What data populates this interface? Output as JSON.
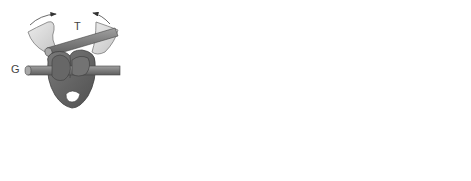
{
  "labels": {
    "t": "T",
    "g": "G"
  },
  "colors": {
    "light_domain": "#d9d9d9",
    "light_domain_stroke": "#7a7a7a",
    "dark_domain": "#6b6b6b",
    "dark_domain_stroke": "#3d3d3d",
    "mid_domain": "#808080",
    "rod": "#8a8a8a",
    "rod_end": "#a8a8a8",
    "arrow": "#333333"
  },
  "stages": [
    {
      "id": "stage-1",
      "description": "Enzyme with T segment entering, G segment bound"
    },
    {
      "id": "stage-2",
      "description": "T segment passes through cleaved G segment"
    },
    {
      "id": "stage-3",
      "description": "G segment resealed, T segment released"
    }
  ]
}
